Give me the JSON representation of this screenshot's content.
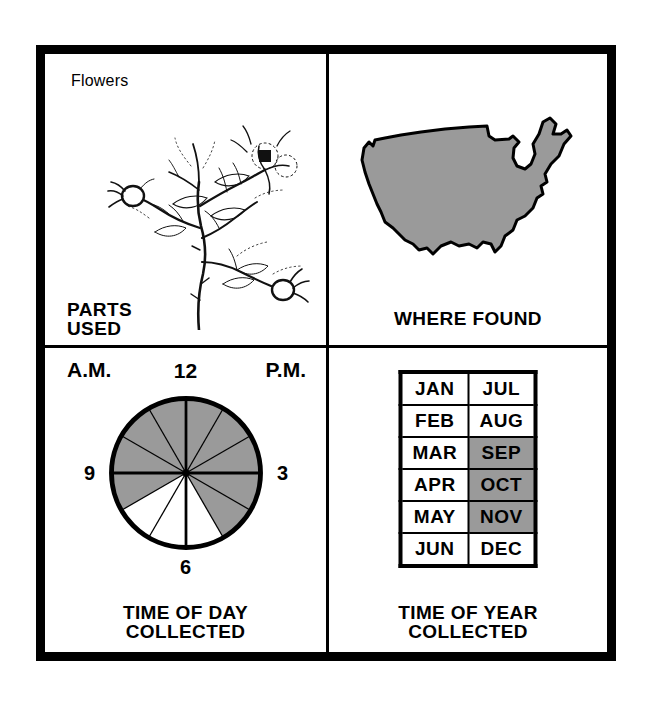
{
  "sheet": {
    "background": "#ffffff",
    "frame_color": "#000000",
    "shade_color": "#9a9a9a"
  },
  "panels": {
    "parts_used": {
      "part_name": "Flowers",
      "caption": "PARTS\nUSED",
      "illustration": "rose-hip-branch-line-drawing"
    },
    "where_found": {
      "caption": "WHERE FOUND",
      "map": "united-states-silhouette",
      "map_fill": "#9a9a9a"
    },
    "time_of_day": {
      "caption": "TIME OF DAY\nCOLLECTED",
      "am_label": "A.M.",
      "pm_label": "P.M.",
      "hour_labels": {
        "top": "12",
        "left": "9",
        "right": "3",
        "bottom": "6"
      }
    },
    "time_of_year": {
      "caption": "TIME OF YEAR\nCOLLECTED",
      "columns": [
        [
          "JAN",
          "FEB",
          "MAR",
          "APR",
          "MAY",
          "JUN"
        ],
        [
          "JUL",
          "AUG",
          "SEP",
          "OCT",
          "NOV",
          "DEC"
        ]
      ],
      "shaded_months": [
        "SEP",
        "OCT",
        "NOV"
      ]
    }
  },
  "chart_data": [
    {
      "type": "pie",
      "title": "TIME OF DAY COLLECTED",
      "categories": [
        "12-1",
        "1-2",
        "2-3",
        "3-4",
        "4-5",
        "5-6",
        "6-7",
        "7-8",
        "8-9",
        "9-10",
        "10-11",
        "11-12"
      ],
      "values": [
        30,
        30,
        30,
        30,
        30,
        30,
        30,
        30,
        30,
        30,
        30,
        30
      ],
      "selected": [
        "12-1",
        "1-2",
        "2-3",
        "3-4",
        "4-5",
        "8-9",
        "9-10",
        "10-11",
        "11-12"
      ],
      "unselected": [
        "5-6",
        "6-7",
        "7-8"
      ],
      "fill_selected": "#9a9a9a",
      "fill_unselected": "#ffffff",
      "annotations": [
        "A.M.",
        "P.M.",
        "12",
        "3",
        "6",
        "9"
      ],
      "legend": "shaded sectors = hours collected",
      "grid": false
    },
    {
      "type": "table",
      "title": "TIME OF YEAR COLLECTED",
      "categories": [
        "JAN",
        "FEB",
        "MAR",
        "APR",
        "MAY",
        "JUN",
        "JUL",
        "AUG",
        "SEP",
        "OCT",
        "NOV",
        "DEC"
      ],
      "values": [
        0,
        0,
        0,
        0,
        0,
        0,
        0,
        0,
        1,
        1,
        1,
        0
      ],
      "legend": "1 = shaded (collected), 0 = unshaded",
      "fill_selected": "#9a9a9a",
      "fill_unselected": "#ffffff"
    }
  ]
}
